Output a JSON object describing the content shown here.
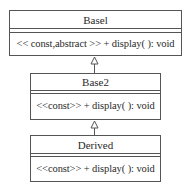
{
  "diagram": {
    "type": "uml-class-diagram",
    "classes": [
      {
        "name": "Basel",
        "attributes": [],
        "operations": [
          "<< const,abstract >> + display( ): void"
        ]
      },
      {
        "name": "Base2",
        "attributes": [],
        "operations": [
          "<<const>> + display( ): void"
        ]
      },
      {
        "name": "Derived",
        "attributes": [],
        "operations": [
          "<<const>> + display( ): void"
        ]
      }
    ],
    "relationships": [
      {
        "type": "generalization",
        "from": "Base2",
        "to": "Basel"
      },
      {
        "type": "generalization",
        "from": "Derived",
        "to": "Base2"
      }
    ],
    "colors": {
      "line": "#555555",
      "text": "#2a2a2a",
      "background": "#ffffff"
    }
  }
}
